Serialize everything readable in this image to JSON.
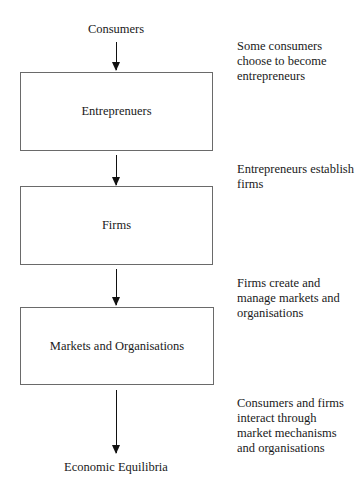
{
  "diagram": {
    "start_node": "Consumers",
    "boxes": [
      {
        "label": "Entreprenuers"
      },
      {
        "label": "Firms"
      },
      {
        "label": "Markets and Organisations"
      }
    ],
    "end_node": "Economic Equilibria",
    "edge_notes": [
      "Some consumers choose to become entrepreneurs",
      "Entrepreneurs establish firms",
      "Firms create and manage markets and organisations",
      "Consumers and firms interact through market mechanisms and organisations"
    ]
  }
}
